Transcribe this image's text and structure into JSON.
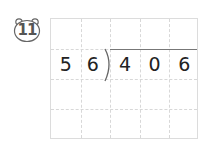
{
  "problem": {
    "number": "11",
    "divisor": [
      "5",
      "6"
    ],
    "dividend": [
      "4",
      "0",
      "6"
    ]
  },
  "grid": {
    "columns": 5,
    "rows": 4
  }
}
